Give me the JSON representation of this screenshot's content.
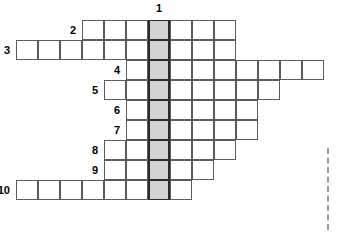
{
  "puzzle": {
    "type": "crossword-skeleton-grid",
    "geometry": {
      "cell_width": 22,
      "cell_height": 20,
      "origin_x": 38,
      "origin_y": 20,
      "highlight_column_index": 5
    },
    "column_label": {
      "text": "1",
      "column_index": 5
    },
    "rows": [
      {
        "label": "2",
        "start_col": 2,
        "length": 7
      },
      {
        "label": "3",
        "start_col": -1,
        "length": 10
      },
      {
        "label": "4",
        "start_col": 4,
        "length": 9
      },
      {
        "label": "5",
        "start_col": 3,
        "length": 8
      },
      {
        "label": "6",
        "start_col": 4,
        "length": 6
      },
      {
        "label": "7",
        "start_col": 4,
        "length": 6
      },
      {
        "label": "8",
        "start_col": 3,
        "length": 6
      },
      {
        "label": "9",
        "start_col": 3,
        "length": 5
      },
      {
        "label": "10",
        "start_col": -1,
        "length": 8
      }
    ],
    "colors": {
      "cell_fill": "#ffffff",
      "cell_border": "#5b5b5b",
      "highlight_fill": "#d2d2d2",
      "highlight_border": "#2b2b2b",
      "label_text": "#000000",
      "dashed_rule": "#9a9a9a",
      "background": "#ffffff"
    },
    "dashed_rule": {
      "x": 327,
      "y": 148,
      "height": 82
    }
  }
}
